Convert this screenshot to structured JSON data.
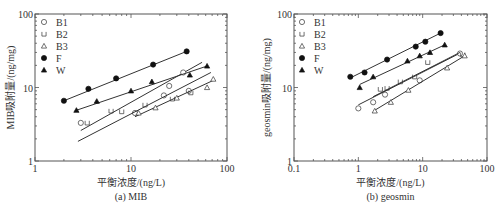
{
  "chart_data": [
    {
      "type": "scatter",
      "panel": "a",
      "title": "",
      "caption": "(a) MIB",
      "xlabel": "平衡浓度/(ng/L)",
      "ylabel": "MIB吸附量/(ng/mg)",
      "xscale": "log",
      "yscale": "log",
      "xlim": [
        1,
        100
      ],
      "ylim": [
        1,
        100
      ],
      "xticks": [
        "1",
        "10",
        "100"
      ],
      "yticks": [
        "1",
        "10",
        "100"
      ],
      "grid": false,
      "legend_position": "upper-left",
      "series": [
        {
          "name": "B1",
          "marker": "open-circle",
          "x": [
            3.0,
            11,
            22,
            25,
            35,
            40
          ],
          "y": [
            3.3,
            4.5,
            7.8,
            10.5,
            16,
            9.0
          ],
          "fit": {
            "x": [
              3.0,
              55
            ],
            "y": [
              2.6,
              22
            ]
          }
        },
        {
          "name": "B2",
          "marker": "open-square",
          "x": [
            3.5,
            6.2,
            8,
            14,
            27,
            42
          ],
          "y": [
            3.3,
            4.8,
            4.7,
            5.8,
            7.0,
            8.5
          ],
          "fit": {
            "x": [
              2.8,
              68
            ],
            "y": [
              1.85,
              16
            ]
          }
        },
        {
          "name": "B3",
          "marker": "open-triangle",
          "x": [
            12,
            18,
            30,
            62,
            72
          ],
          "y": [
            4.5,
            5.3,
            7.2,
            10,
            13
          ],
          "fit": {
            "x": [
              11,
              72
            ],
            "y": [
              4.0,
              12.5
            ]
          }
        },
        {
          "name": "F",
          "marker": "filled-circle",
          "x": [
            2.0,
            3.6,
            7.0,
            17,
            38
          ],
          "y": [
            6.6,
            9.6,
            13.3,
            20.5,
            31
          ],
          "fit": {
            "x": [
              2.0,
              38
            ],
            "y": [
              6.6,
              31
            ]
          }
        },
        {
          "name": "W",
          "marker": "filled-triangle",
          "x": [
            2.7,
            4.4,
            10,
            16.5,
            41,
            62
          ],
          "y": [
            4.9,
            6.5,
            9.0,
            12,
            14.8,
            19.6
          ],
          "fit": {
            "x": [
              2.7,
              62
            ],
            "y": [
              4.9,
              19.6
            ]
          }
        }
      ]
    },
    {
      "type": "scatter",
      "panel": "b",
      "title": "",
      "caption": "(b) geosmin",
      "xlabel": "平衡浓度/(ng/L)",
      "ylabel": "geosmin吸附量/(ng/mg)",
      "xscale": "log",
      "yscale": "log",
      "xlim": [
        0.1,
        100
      ],
      "ylim": [
        1,
        100
      ],
      "xticks": [
        "0.1",
        "1",
        "10",
        "100"
      ],
      "yticks": [
        "1",
        "10",
        "100"
      ],
      "grid": false,
      "legend_position": "upper-left",
      "series": [
        {
          "name": "B1",
          "marker": "open-circle",
          "x": [
            1.0,
            1.7,
            2.6,
            9,
            38
          ],
          "y": [
            5.2,
            6.3,
            8.0,
            12.5,
            29
          ],
          "fit": {
            "x": [
              1.0,
              40
            ],
            "y": [
              5.8,
              30
            ]
          }
        },
        {
          "name": "B2",
          "marker": "open-square",
          "x": [
            2.2,
            2.8,
            4.5,
            7.5,
            12,
            42
          ],
          "y": [
            9.5,
            9.8,
            12,
            14,
            22,
            28
          ],
          "fit": {
            "x": [
              1.7,
              38
            ],
            "y": [
              7.5,
              30
            ]
          }
        },
        {
          "name": "B3",
          "marker": "open-triangle",
          "x": [
            1.8,
            3.2,
            6,
            24,
            45
          ],
          "y": [
            4.8,
            6.3,
            9.2,
            18.5,
            27
          ],
          "fit": {
            "x": [
              1.8,
              45
            ],
            "y": [
              4.9,
              27
            ]
          }
        },
        {
          "name": "F",
          "marker": "filled-circle",
          "x": [
            0.75,
            1.25,
            2.8,
            7.8,
            11,
            19
          ],
          "y": [
            14,
            16,
            24,
            36,
            42,
            55
          ],
          "fit": {
            "x": [
              0.75,
              19
            ],
            "y": [
              13.5,
              55
            ]
          }
        },
        {
          "name": "W",
          "marker": "filled-triangle",
          "x": [
            1.05,
            1.7,
            5.8,
            9,
            13,
            22
          ],
          "y": [
            10,
            14,
            23,
            27,
            30,
            38
          ],
          "fit": {
            "x": [
              1.05,
              22
            ],
            "y": [
              11,
              38
            ]
          }
        }
      ]
    }
  ]
}
